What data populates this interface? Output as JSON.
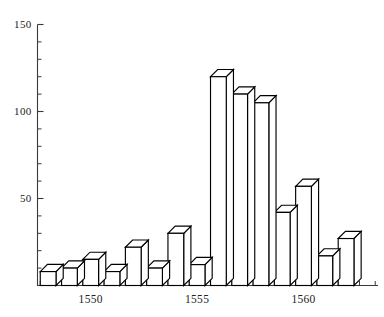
{
  "chart_data": {
    "type": "bar",
    "title": "",
    "subtitle": "",
    "xlabel": "",
    "ylabel": "",
    "style": "3d-block-bars",
    "grid": false,
    "legend": null,
    "categories": [
      1548,
      1549,
      1550,
      1551,
      1552,
      1553,
      1554,
      1555,
      1556,
      1557,
      1558,
      1559,
      1560,
      1561,
      1562,
      1563
    ],
    "values": [
      8,
      10,
      15,
      8,
      22,
      10,
      30,
      12,
      120,
      110,
      105,
      42,
      57,
      17,
      27,
      0
    ],
    "xlim": [
      1547.5,
      1563.5
    ],
    "ylim": [
      0,
      150
    ],
    "yticks": [
      0,
      10,
      20,
      30,
      40,
      50,
      60,
      70,
      80,
      90,
      100,
      110,
      120,
      130,
      140,
      150
    ],
    "ytick_labels_shown": [
      "50",
      "100",
      "150"
    ],
    "xticks": [
      1550,
      1555,
      1560
    ],
    "xtick_labels": [
      "1550",
      "1555",
      "1560"
    ],
    "axis_color": "#3a3a3a",
    "bar_stroke": "#000000",
    "bar_fill": "#ffffff",
    "background": "#ffffff"
  },
  "axes": {
    "y_labels": [
      {
        "value": 150,
        "text": "150"
      },
      {
        "value": 100,
        "text": "100"
      },
      {
        "value": 50,
        "text": "50"
      }
    ],
    "x_labels": [
      {
        "value": 1550,
        "text": "1550"
      },
      {
        "value": 1555,
        "text": "1555"
      },
      {
        "value": 1560,
        "text": "1560"
      }
    ]
  }
}
